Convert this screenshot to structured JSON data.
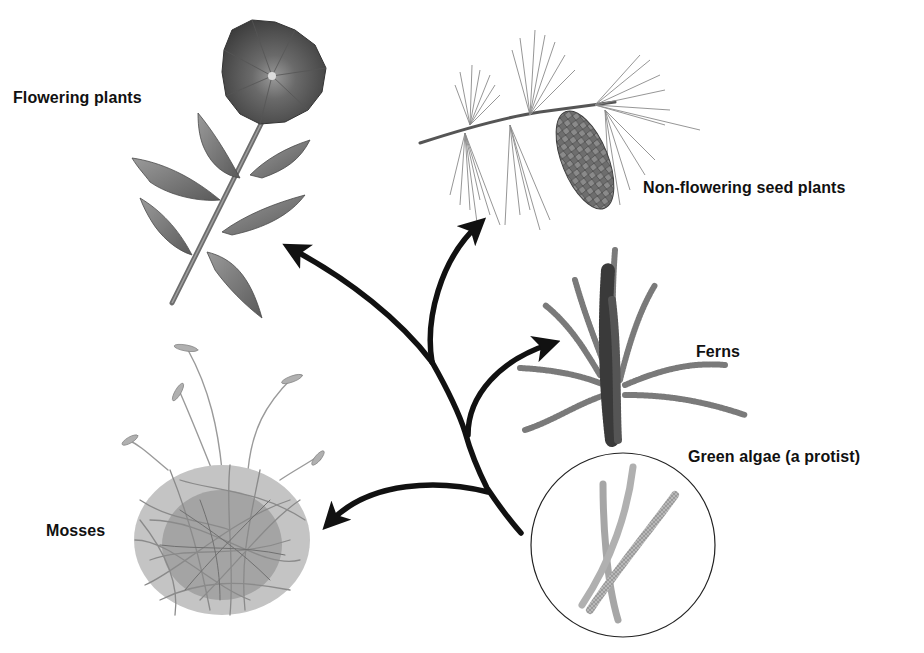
{
  "diagram": {
    "type": "phylogenetic tree of plants",
    "root": "Green algae (a protist)",
    "labels": {
      "flowering": "Flowering plants",
      "non_flowering": "Non-flowering seed plants",
      "ferns": "Ferns",
      "algae": "Green algae (a protist)",
      "mosses": "Mosses"
    },
    "branches": [
      {
        "from": "Green algae (a protist)",
        "to": "Mosses"
      },
      {
        "from": "Green algae (a protist)",
        "to": "Ferns"
      },
      {
        "from": "Green algae (a protist)",
        "to": "Non-flowering seed plants"
      },
      {
        "from": "Green algae (a protist)",
        "to": "Flowering plants"
      }
    ],
    "illustrations": {
      "flowering": "flower-illustration",
      "non_flowering": "pine-branch-with-cone-illustration",
      "ferns": "fern-illustration",
      "algae": "algae-filaments-in-circle-illustration",
      "mosses": "moss-clump-illustration"
    },
    "colors": {
      "arrow": "#111111",
      "plant_gray": "#8a8a8a",
      "dark_gray": "#4a4a4a",
      "background": "#ffffff"
    }
  }
}
